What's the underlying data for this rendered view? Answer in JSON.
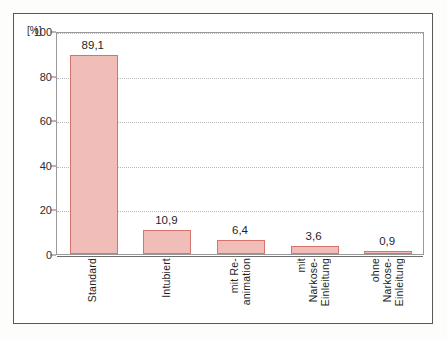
{
  "chart_data": {
    "type": "bar",
    "title": "",
    "subtitle": "",
    "xlabel": "",
    "ylabel": "",
    "yunit": "[%]",
    "categories": [
      "Standard",
      "Intubiert",
      "mit Re-\nanimation",
      "mit\nNarkose-\nEinleitung",
      "ohne\nNarkose-\nEinleitung"
    ],
    "category_lines": [
      [
        "Standard"
      ],
      [
        "Intubiert"
      ],
      [
        "mit Re-",
        "animation"
      ],
      [
        "mit",
        "Narkose-",
        "Einleitung"
      ],
      [
        "ohne",
        "Narkose-",
        "Einleitung"
      ]
    ],
    "values": [
      89.1,
      10.9,
      6.4,
      3.6,
      0.9
    ],
    "value_labels": [
      "89,1",
      "10,9",
      "6,4",
      "3,6",
      "0,9"
    ],
    "ylim": [
      0,
      100
    ],
    "yticks": [
      0,
      20,
      40,
      60,
      80,
      100
    ],
    "ytick_labels": [
      "0",
      "20",
      "40",
      "60",
      "80",
      "100"
    ],
    "grid": "horizontal-dotted",
    "legend": "none",
    "bar_fill_color": "#f0bdb8",
    "bar_edge_color": "#d4746c",
    "axis_color": "#6e6e6e",
    "grid_color": "#b9b9b9",
    "frame_color": "#58585a",
    "background_color": "#ffffff"
  }
}
